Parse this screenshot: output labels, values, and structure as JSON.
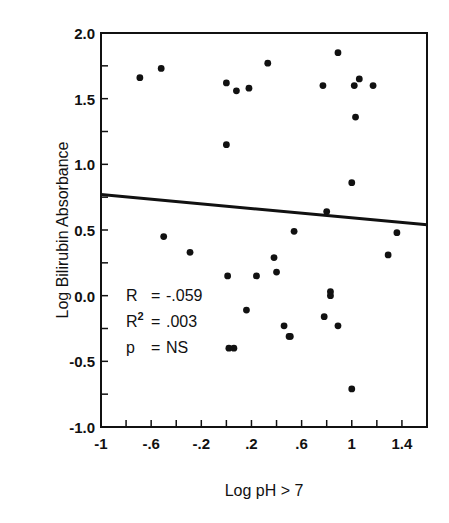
{
  "chart_data": {
    "type": "scatter",
    "title": "",
    "xlabel": "Log pH > 7",
    "ylabel": "Log Bilirubin Absorbance",
    "xlim": [
      -1,
      1.6
    ],
    "ylim": [
      -1.0,
      2.0
    ],
    "x_ticks": [
      -1,
      -0.8,
      -0.6,
      -0.4,
      -0.2,
      0,
      0.2,
      0.4,
      0.6,
      0.8,
      1.0,
      1.2,
      1.4
    ],
    "x_tick_labels": [
      {
        "value": -1,
        "label": "-1"
      },
      {
        "value": -0.6,
        "label": "-.6"
      },
      {
        "value": -0.2,
        "label": "-.2"
      },
      {
        "value": 0.2,
        "label": ".2"
      },
      {
        "value": 0.6,
        "label": ".6"
      },
      {
        "value": 1.0,
        "label": "1"
      },
      {
        "value": 1.4,
        "label": "1.4"
      }
    ],
    "y_ticks": [
      -1.0,
      -0.75,
      -0.5,
      -0.25,
      0,
      0.25,
      0.5,
      0.75,
      1.0,
      1.25,
      1.5,
      1.75,
      2.0
    ],
    "y_tick_labels": [
      {
        "value": 2.0,
        "label": "2.0"
      },
      {
        "value": 1.5,
        "label": "1.5"
      },
      {
        "value": 1.0,
        "label": "1.0"
      },
      {
        "value": 0.5,
        "label": "0.5"
      },
      {
        "value": 0.0,
        "label": "0.0"
      },
      {
        "value": -0.5,
        "label": "-0.5"
      },
      {
        "value": -1.0,
        "label": "-1.0"
      }
    ],
    "grid": false,
    "legend": null,
    "series": [
      {
        "name": "observations",
        "points": [
          [
            -0.69,
            1.66
          ],
          [
            -0.52,
            1.73
          ],
          [
            0.0,
            1.62
          ],
          [
            0.08,
            1.56
          ],
          [
            0.18,
            1.58
          ],
          [
            0.33,
            1.77
          ],
          [
            0.77,
            1.6
          ],
          [
            0.89,
            1.85
          ],
          [
            1.02,
            1.6
          ],
          [
            1.06,
            1.65
          ],
          [
            1.17,
            1.6
          ],
          [
            1.03,
            1.36
          ],
          [
            0.0,
            1.15
          ],
          [
            1.0,
            0.86
          ],
          [
            0.8,
            0.64
          ],
          [
            -0.5,
            0.45
          ],
          [
            -0.29,
            0.33
          ],
          [
            0.54,
            0.49
          ],
          [
            1.36,
            0.48
          ],
          [
            1.29,
            0.31
          ],
          [
            0.01,
            0.15
          ],
          [
            0.24,
            0.15
          ],
          [
            0.38,
            0.29
          ],
          [
            0.4,
            0.18
          ],
          [
            0.16,
            -0.11
          ],
          [
            0.02,
            -0.4
          ],
          [
            0.06,
            -0.4
          ],
          [
            0.46,
            -0.23
          ],
          [
            0.5,
            -0.31
          ],
          [
            0.51,
            -0.31
          ],
          [
            0.78,
            -0.16
          ],
          [
            0.83,
            0.03
          ],
          [
            0.83,
            0.0
          ],
          [
            0.89,
            -0.23
          ],
          [
            1.0,
            -0.71
          ]
        ]
      }
    ],
    "regression_line": {
      "x": [
        -1.0,
        1.6
      ],
      "y": [
        0.77,
        0.54
      ]
    },
    "annotations": [
      {
        "label": "R",
        "eq": "=",
        "value": "-.059"
      },
      {
        "label": "R",
        "sup": "2",
        "eq": "=",
        "value": ".003"
      },
      {
        "label": "p",
        "eq": "=",
        "value": "NS"
      }
    ]
  }
}
